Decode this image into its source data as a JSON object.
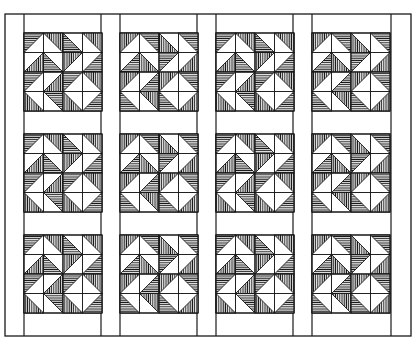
{
  "image": {
    "width": 418,
    "height": 344,
    "background": "#ffffff",
    "ink": "#1a1a1a"
  },
  "quilt": {
    "description": "Quilt layout of 12 pinwheel-style half-square-triangle blocks in 4 columns x 3 rows, separated by vertical sashing strips and horizontal white spacers",
    "outer_frame": {
      "x": 5,
      "y": 14,
      "w": 406,
      "h": 322
    },
    "vertical_sashing_lines_x": [
      24,
      101,
      120,
      197,
      216,
      293,
      312,
      391
    ],
    "columns_x": [
      24,
      120,
      216,
      312
    ],
    "rows_y": [
      33,
      134,
      235
    ],
    "block_size": 78,
    "grid": 4,
    "block_pattern": [
      [
        "TL",
        "TR",
        "BL",
        "TR"
      ],
      [
        "BR",
        "BL",
        "TL",
        "BR"
      ],
      [
        "TL",
        "BR",
        "TL",
        "TR"
      ],
      [
        "BL",
        "TR",
        "BL",
        "BR"
      ]
    ],
    "hatch_styles": [
      "horizontal",
      "vertical"
    ],
    "block_count": 12
  }
}
